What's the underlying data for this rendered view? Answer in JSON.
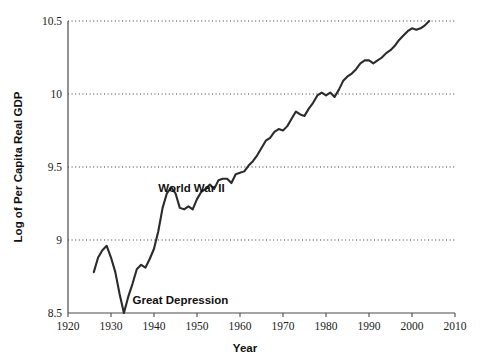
{
  "chart_data": {
    "type": "line",
    "title": "",
    "xlabel": "Year",
    "ylabel": "Log of Per Capita Real GDP",
    "xlim": [
      1920,
      2010
    ],
    "ylim": [
      8.5,
      10.5
    ],
    "xticks": [
      1920,
      1930,
      1940,
      1950,
      1960,
      1970,
      1980,
      1990,
      2000,
      2010
    ],
    "yticks": [
      8.5,
      9,
      9.5,
      10,
      10.5
    ],
    "ytick_labels": [
      "8.5",
      "9",
      "9.5",
      "10",
      "10.5"
    ],
    "xtick_labels": [
      "1920",
      "1930",
      "1940",
      "1950",
      "1960",
      "1970",
      "1980",
      "1990",
      "2000",
      "2010"
    ],
    "grid": "horizontal-dotted",
    "gridlines_at": [
      9,
      9.5,
      10,
      10.5
    ],
    "legend": "none",
    "line_color": "#2b2b2b",
    "annotations": [
      {
        "text": "World War II",
        "x": 1941,
        "y": 9.33
      },
      {
        "text": "Great Depression",
        "x": 1935,
        "y": 8.56
      }
    ],
    "x": [
      1926,
      1927,
      1928,
      1929,
      1930,
      1931,
      1932,
      1933,
      1934,
      1935,
      1936,
      1937,
      1938,
      1939,
      1940,
      1941,
      1942,
      1943,
      1944,
      1945,
      1946,
      1947,
      1948,
      1949,
      1950,
      1951,
      1952,
      1953,
      1954,
      1955,
      1956,
      1957,
      1958,
      1959,
      1960,
      1961,
      1962,
      1963,
      1964,
      1965,
      1966,
      1967,
      1968,
      1969,
      1970,
      1971,
      1972,
      1973,
      1974,
      1975,
      1976,
      1977,
      1978,
      1979,
      1980,
      1981,
      1982,
      1983,
      1984,
      1985,
      1986,
      1987,
      1988,
      1989,
      1990,
      1991,
      1992,
      1993,
      1994,
      1995,
      1996,
      1997,
      1998,
      1999,
      2000,
      2001,
      2002,
      2003,
      2004
    ],
    "y": [
      8.78,
      8.88,
      8.93,
      8.96,
      8.88,
      8.78,
      8.63,
      8.5,
      8.61,
      8.7,
      8.8,
      8.83,
      8.81,
      8.87,
      8.94,
      9.06,
      9.22,
      9.32,
      9.36,
      9.32,
      9.22,
      9.21,
      9.23,
      9.21,
      9.28,
      9.33,
      9.35,
      9.38,
      9.35,
      9.41,
      9.42,
      9.42,
      9.39,
      9.45,
      9.46,
      9.47,
      9.51,
      9.54,
      9.58,
      9.63,
      9.68,
      9.7,
      9.74,
      9.76,
      9.75,
      9.78,
      9.83,
      9.88,
      9.86,
      9.85,
      9.9,
      9.94,
      9.99,
      10.01,
      9.99,
      10.01,
      9.98,
      10.03,
      10.09,
      10.12,
      10.14,
      10.17,
      10.21,
      10.23,
      10.23,
      10.21,
      10.23,
      10.25,
      10.28,
      10.3,
      10.33,
      10.37,
      10.4,
      10.43,
      10.45,
      10.44,
      10.45,
      10.47,
      10.5
    ]
  },
  "axes": {
    "y_title": "Log of Per Capita Real GDP",
    "x_title": "Year"
  }
}
